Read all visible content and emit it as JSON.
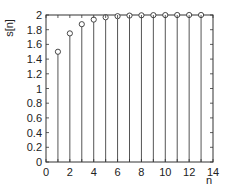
{
  "chart_data": {
    "type": "stem",
    "title": "",
    "xlabel": "n",
    "ylabel": "s[n]",
    "xlim": [
      0,
      14
    ],
    "ylim": [
      0,
      2
    ],
    "xticks": [
      0,
      2,
      4,
      6,
      8,
      10,
      12,
      14
    ],
    "yticks": [
      0,
      0.2,
      0.4,
      0.6,
      0.8,
      1,
      1.2,
      1.4,
      1.6,
      1.8,
      2
    ],
    "ytick_labels": [
      "0",
      "0.2",
      "0.4",
      "0.6",
      "0.8",
      "1",
      "1.2",
      "1.4",
      "1.6",
      "1.8",
      "2"
    ],
    "grid": false,
    "legend": null,
    "x": [
      1,
      2,
      3,
      4,
      5,
      6,
      7,
      8,
      9,
      10,
      11,
      12,
      13
    ],
    "values": [
      1.5,
      1.75,
      1.875,
      1.9375,
      1.969,
      1.984,
      1.992,
      1.996,
      1.998,
      1.999,
      2.0,
      2.0,
      2.0
    ],
    "marker": "open-circle",
    "stem_color": "#555555",
    "axis_color": "#333333"
  }
}
